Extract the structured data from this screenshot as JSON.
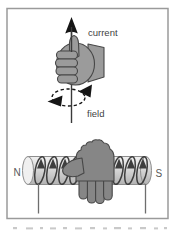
{
  "diagram": {
    "labels": {
      "current": "current",
      "field": "field",
      "north_pole": "N",
      "south_pole": "S"
    }
  },
  "colors": {
    "background": "#ffffff",
    "frame_border": "#9a9a9a",
    "wire": "#3a3a3a",
    "arrow": "#161616",
    "hand_fill": "#9b9b9b",
    "hand_fill_dark": "#868686",
    "hand_outline": "#474747",
    "coil": "#3e3e3e",
    "cylinder_light": "#f0f0f0",
    "cylinder_mid": "#d8d8d8",
    "cylinder_dark": "#b2b2b2",
    "cylinder_stroke": "#8d8d8d",
    "lead_wire": "#6e6e6e",
    "label_text": "#3f3f3f",
    "pole_text": "#595959",
    "caption_remnant": "#c9c9c9"
  }
}
